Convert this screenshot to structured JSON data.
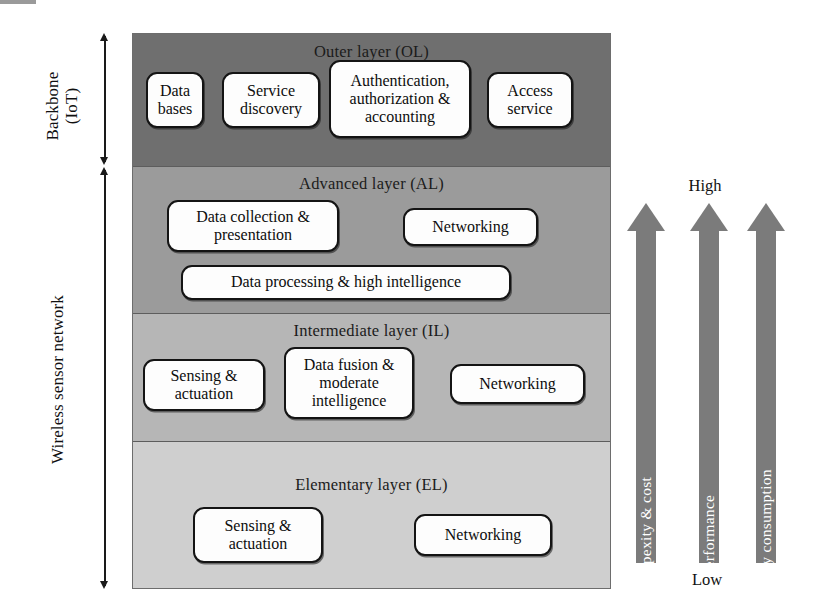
{
  "figure": {
    "left_axis": [
      {
        "label": "Backbone\n(IoT)",
        "span": "outer-layer"
      },
      {
        "label": "Wireless sensor network",
        "span": "advanced-intermediate-elementary"
      }
    ],
    "layers": [
      {
        "id": "outer-layer",
        "title": "Outer layer (OL)",
        "shade": "#6f6f6f",
        "nodes": [
          {
            "label": "Data\nbases"
          },
          {
            "label": "Service\ndiscovery"
          },
          {
            "label": "Authentication,\nauthorization &\naccounting"
          },
          {
            "label": "Access\nservice"
          }
        ]
      },
      {
        "id": "advanced-layer",
        "title": "Advanced layer (AL)",
        "shade": "#9b9b9b",
        "nodes": [
          {
            "label": "Data collection &\npresentation"
          },
          {
            "label": "Networking"
          },
          {
            "label": "Data processing & high intelligence"
          }
        ]
      },
      {
        "id": "intermediate-layer",
        "title": "Intermediate layer (IL)",
        "shade": "#b6b6b6",
        "nodes": [
          {
            "label": "Sensing &\nactuation"
          },
          {
            "label": "Data fusion &\nmoderate\nintelligence"
          },
          {
            "label": "Networking"
          }
        ]
      },
      {
        "id": "elementary-layer",
        "title": "Elementary layer (EL)",
        "shade": "#cfcfcf",
        "nodes": [
          {
            "label": "Sensing &\nactuation"
          },
          {
            "label": "Networking"
          }
        ]
      }
    ],
    "scales": {
      "top_label": "High",
      "bottom_label": "Low",
      "arrow_color": "#7b7b7b",
      "arrows": [
        {
          "label": "Compexity & cost"
        },
        {
          "label": "Performance"
        },
        {
          "label": "Energy consumption"
        }
      ]
    }
  }
}
